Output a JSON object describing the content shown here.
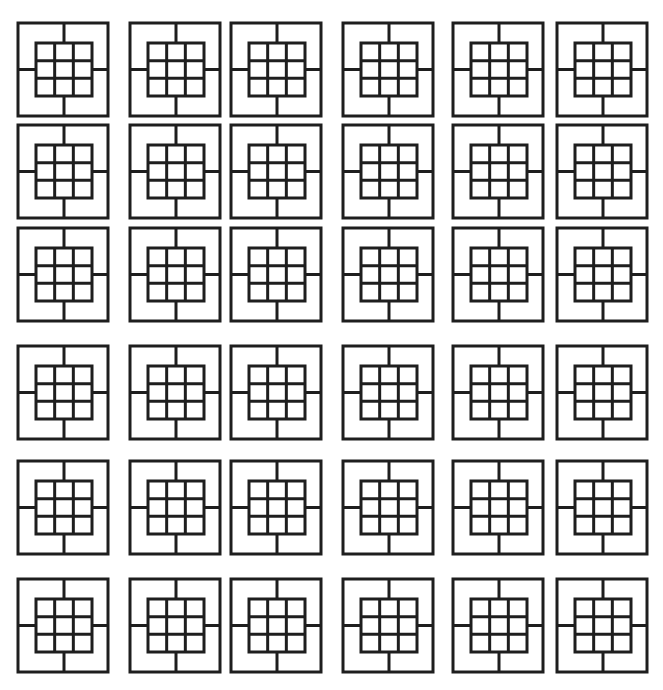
{
  "pattern": {
    "description": "6x6 grid of square tiles, each an outer square divided by four spokes around a central 3x3 grid",
    "stroke_color": "#1e1e1e",
    "background_color": "#ffffff",
    "stroke_width": 3,
    "tile_size": [
      90,
      93
    ],
    "inner_grid": {
      "rows": 3,
      "cols": 3,
      "offset": [
        18,
        20
      ],
      "size": [
        56,
        53
      ]
    },
    "columns_x": [
      18,
      130,
      231,
      343,
      453,
      557
    ],
    "rows_y": [
      23,
      125,
      228,
      346,
      461,
      579
    ]
  }
}
